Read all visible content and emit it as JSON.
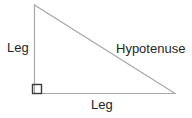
{
  "figure": {
    "kind": "right-triangle-diagram",
    "background_color": "#ffffff",
    "stroke_color": "#a8a8a8",
    "stroke_width": 1,
    "text_color": "#252525",
    "vertices": {
      "apex": [
        34,
        5
      ],
      "right_angle": [
        34,
        93
      ],
      "base_right": [
        175,
        93
      ]
    },
    "right_angle_marker": {
      "name": "right-angle-square",
      "x": 32,
      "y": 84,
      "size": 9,
      "stroke_color": "#3a3a3a",
      "stroke_width": 1.4
    }
  },
  "labels": {
    "leg_vertical": "Leg",
    "hypotenuse": "Hypotenuse",
    "leg_horizontal": "Leg"
  }
}
